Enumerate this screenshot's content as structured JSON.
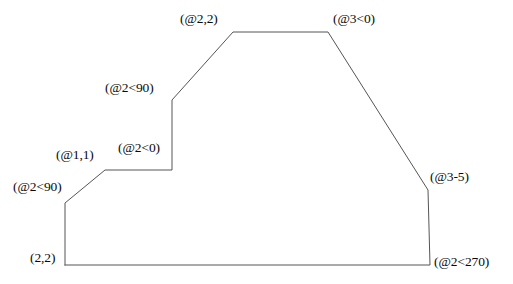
{
  "diagram": {
    "type": "polyline-outline",
    "stroke_color": "#555555",
    "text_color": "#0a0a0a",
    "background_color": "#ffffff",
    "stroke_width": 1,
    "width": 513,
    "height": 284,
    "vertices": [
      {
        "id": "v1",
        "x": 65,
        "y": 265,
        "label": "(2,2)",
        "label_x": 30,
        "label_y": 258,
        "entry_type": "absolute"
      },
      {
        "id": "v2",
        "x": 65,
        "y": 203,
        "label": "(@2<90)",
        "label_x": 13,
        "label_y": 180,
        "entry_type": "polar"
      },
      {
        "id": "v3",
        "x": 105,
        "y": 170,
        "label": "(@1,1)",
        "label_x": 56,
        "label_y": 148,
        "entry_type": "relative"
      },
      {
        "id": "v4",
        "x": 172,
        "y": 170,
        "label": "(@2<0)",
        "label_x": 118,
        "label_y": 141,
        "entry_type": "polar"
      },
      {
        "id": "v5",
        "x": 172,
        "y": 100,
        "label": "(@2<90)",
        "label_x": 105,
        "label_y": 81,
        "entry_type": "polar"
      },
      {
        "id": "v6",
        "x": 233,
        "y": 32,
        "label": "(@2,2)",
        "label_x": 180,
        "label_y": 12,
        "entry_type": "relative"
      },
      {
        "id": "v7",
        "x": 328,
        "y": 32,
        "label": "(@3<0)",
        "label_x": 333,
        "label_y": 12,
        "entry_type": "polar"
      },
      {
        "id": "v8",
        "x": 428,
        "y": 190,
        "label": "(@3-5)",
        "label_x": 430,
        "label_y": 170,
        "entry_type": "relative"
      },
      {
        "id": "v9",
        "x": 430,
        "y": 265,
        "label": "(@2<270)",
        "label_x": 434,
        "label_y": 255,
        "entry_type": "polar"
      }
    ],
    "path_points": "65,265 65,203 105,170 172,170 172,100 233,32 328,32 428,190 430,265 65,265"
  }
}
